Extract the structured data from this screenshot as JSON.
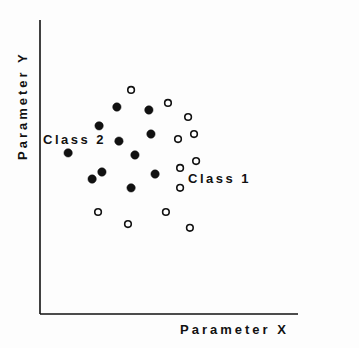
{
  "chart_data": {
    "type": "scatter",
    "title": "",
    "xlabel": "Parameter X",
    "ylabel": "Parameter Y",
    "xlim": [
      0,
      100
    ],
    "ylim": [
      0,
      100
    ],
    "grid": false,
    "ticks": false,
    "legend": "none (inline class labels)",
    "series": [
      {
        "name": "Class 1",
        "marker": "open-circle",
        "annotation": {
          "text": "Class 1",
          "x": 57.4,
          "y": 46.3
        },
        "points": [
          [
            35.3,
            76.2
          ],
          [
            49.6,
            71.8
          ],
          [
            57.4,
            67.0
          ],
          [
            53.5,
            59.5
          ],
          [
            59.7,
            61.2
          ],
          [
            60.5,
            52.0
          ],
          [
            54.3,
            49.7
          ],
          [
            54.3,
            42.9
          ],
          [
            48.8,
            34.7
          ],
          [
            58.1,
            29.3
          ],
          [
            22.5,
            34.7
          ],
          [
            34.1,
            30.6
          ]
        ]
      },
      {
        "name": "Class 2",
        "marker": "filled-circle",
        "annotation": {
          "text": "Class 2",
          "x": 1.2,
          "y": 59.2
        },
        "points": [
          [
            29.8,
            70.4
          ],
          [
            42.2,
            69.4
          ],
          [
            22.9,
            64.0
          ],
          [
            30.6,
            58.8
          ],
          [
            43.0,
            61.2
          ],
          [
            10.9,
            54.8
          ],
          [
            36.8,
            54.1
          ],
          [
            24.0,
            48.3
          ],
          [
            20.2,
            45.9
          ],
          [
            35.3,
            42.9
          ],
          [
            44.6,
            47.6
          ]
        ]
      }
    ]
  },
  "axes": {
    "x_label": "Parameter X",
    "y_label": "Parameter Y"
  },
  "labels": {
    "class1": "Class 1",
    "class2": "Class 2"
  },
  "colors": {
    "ink": "#111111",
    "background": "#fdfdfd"
  }
}
